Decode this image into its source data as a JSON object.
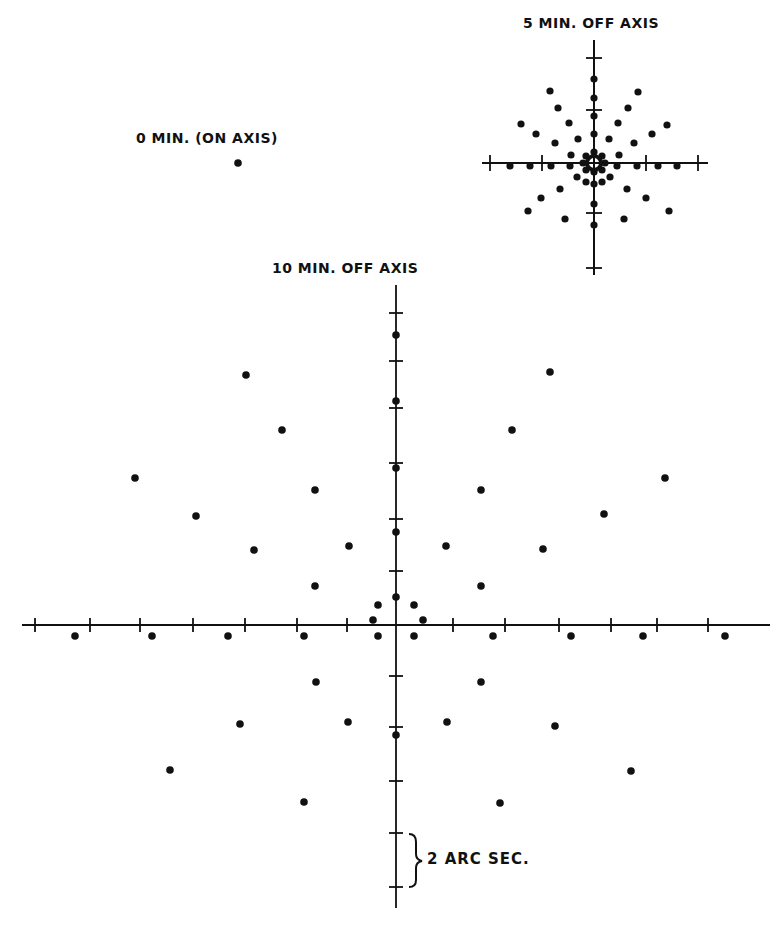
{
  "labels": {
    "on_axis": "0 MIN. (ON AXIS)",
    "five_min": "5 MIN. OFF AXIS",
    "ten_min": "10 MIN. OFF AXIS",
    "scale": "2 ARC SEC."
  },
  "colors": {
    "ink": "#111111",
    "background": "#ffffff"
  },
  "chart_data": [
    {
      "type": "scatter",
      "title": "0 MIN. (ON AXIS)",
      "description": "Single spot diagram point on axis",
      "points_px": [
        [
          238,
          163
        ]
      ]
    },
    {
      "type": "scatter",
      "title": "5 MIN. OFF AXIS",
      "axes": {
        "center_px": [
          594,
          163
        ],
        "h_range_px": [
          482,
          708
        ],
        "v_range_px": [
          40,
          275
        ]
      },
      "ticks_h_px": [
        490,
        542,
        646,
        698
      ],
      "ticks_v_px": [
        58,
        110,
        213,
        268
      ],
      "points_px": [
        [
          594,
          79
        ],
        [
          594,
          98
        ],
        [
          594,
          116
        ],
        [
          594,
          134
        ],
        [
          594,
          184
        ],
        [
          594,
          204
        ],
        [
          594,
          225
        ],
        [
          550,
          91
        ],
        [
          558,
          108
        ],
        [
          569,
          123
        ],
        [
          578,
          139
        ],
        [
          571,
          155
        ],
        [
          638,
          92
        ],
        [
          628,
          108
        ],
        [
          618,
          123
        ],
        [
          609,
          139
        ],
        [
          619,
          155
        ],
        [
          521,
          124
        ],
        [
          536,
          134
        ],
        [
          555,
          143
        ],
        [
          667,
          125
        ],
        [
          652,
          134
        ],
        [
          634,
          143
        ],
        [
          510,
          166
        ],
        [
          530,
          166
        ],
        [
          551,
          166
        ],
        [
          570,
          166
        ],
        [
          617,
          166
        ],
        [
          637,
          166
        ],
        [
          658,
          166
        ],
        [
          677,
          166
        ],
        [
          577,
          177
        ],
        [
          586,
          182
        ],
        [
          602,
          182
        ],
        [
          610,
          177
        ],
        [
          560,
          189
        ],
        [
          541,
          198
        ],
        [
          528,
          211
        ],
        [
          627,
          189
        ],
        [
          646,
          198
        ],
        [
          669,
          211
        ],
        [
          565,
          219
        ],
        [
          624,
          219
        ],
        [
          583,
          163
        ],
        [
          605,
          163
        ],
        [
          594,
          152
        ],
        [
          594,
          172
        ],
        [
          586,
          156
        ],
        [
          602,
          156
        ],
        [
          586,
          170
        ],
        [
          602,
          170
        ]
      ]
    },
    {
      "type": "scatter",
      "title": "10 MIN. OFF AXIS",
      "xlabel": "",
      "ylabel": "",
      "scale_bar": {
        "label": "2 ARC SEC.",
        "tick_spacing_px": 53
      },
      "axes": {
        "center_px": [
          396,
          625
        ],
        "h_range_px": [
          22,
          770
        ],
        "v_range_px": [
          285,
          908
        ]
      },
      "ticks_h_px": [
        35,
        90,
        140,
        193,
        245,
        297,
        347,
        453,
        505,
        559,
        611,
        657,
        708
      ],
      "ticks_v_px": [
        313,
        361,
        408,
        463,
        519,
        571,
        676,
        727,
        781,
        833,
        887
      ],
      "points_px": [
        [
          396,
          335
        ],
        [
          396,
          401
        ],
        [
          396,
          468
        ],
        [
          396,
          532
        ],
        [
          396,
          597
        ],
        [
          378,
          605
        ],
        [
          414,
          605
        ],
        [
          373,
          620
        ],
        [
          423,
          620
        ],
        [
          378,
          636
        ],
        [
          414,
          636
        ],
        [
          396,
          735
        ],
        [
          246,
          375
        ],
        [
          282,
          430
        ],
        [
          315,
          490
        ],
        [
          349,
          546
        ],
        [
          315,
          586
        ],
        [
          135,
          478
        ],
        [
          196,
          516
        ],
        [
          254,
          550
        ],
        [
          550,
          372
        ],
        [
          512,
          430
        ],
        [
          481,
          490
        ],
        [
          446,
          546
        ],
        [
          481,
          586
        ],
        [
          665,
          478
        ],
        [
          604,
          514
        ],
        [
          543,
          549
        ],
        [
          75,
          636
        ],
        [
          152,
          636
        ],
        [
          228,
          636
        ],
        [
          304,
          636
        ],
        [
          493,
          636
        ],
        [
          571,
          636
        ],
        [
          643,
          636
        ],
        [
          725,
          636
        ],
        [
          316,
          682
        ],
        [
          481,
          682
        ],
        [
          240,
          724
        ],
        [
          348,
          722
        ],
        [
          447,
          722
        ],
        [
          555,
          726
        ],
        [
          170,
          770
        ],
        [
          631,
          771
        ],
        [
          304,
          802
        ],
        [
          500,
          803
        ]
      ]
    }
  ]
}
